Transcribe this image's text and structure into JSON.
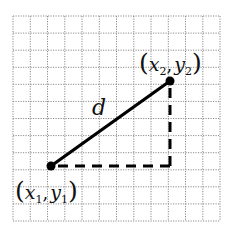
{
  "figure": {
    "type": "distance-diagram",
    "grid": {
      "columns": 12,
      "rows": 12,
      "line_style": "dotted",
      "line_color": "#8a8a8a"
    },
    "points": [
      {
        "id": "p1",
        "label_var_x": "x",
        "label_sub_x": "1",
        "label_var_y": "y",
        "label_sub_y": "1",
        "grid_x": 2,
        "grid_y": 3
      },
      {
        "id": "p2",
        "label_var_x": "x",
        "label_sub_x": "2",
        "label_var_y": "y",
        "label_sub_y": "2",
        "grid_x": 9,
        "grid_y": 8
      }
    ],
    "segment_label": "d",
    "legs": {
      "style": "dashed",
      "color": "#000000"
    },
    "labels": {
      "open_paren": "(",
      "close_paren": ")",
      "comma": ","
    }
  }
}
